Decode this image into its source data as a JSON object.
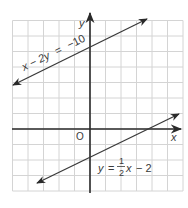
{
  "chart_data": {
    "type": "line",
    "title": "",
    "xlabel": "x",
    "ylabel": "y",
    "origin_label": "O",
    "grid": true,
    "xlim": [
      -5,
      6
    ],
    "ylim": [
      -4,
      7
    ],
    "series": [
      {
        "name": "x - 2y = -10",
        "label_parts": {
          "lhs": "x − 2y",
          "eq": "=",
          "rhs": "−10"
        },
        "slope": 0.5,
        "intercept": 5,
        "x": [
          -5,
          3.6
        ],
        "y": [
          2.5,
          6.8
        ],
        "arrows": "both"
      },
      {
        "name": "y = 1/2x - 2",
        "label_parts": {
          "lhs": "y",
          "eq": "=",
          "num": "1",
          "den": "2",
          "var": "x",
          "rest": "− 2"
        },
        "slope": 0.5,
        "intercept": -2,
        "x": [
          -3.4,
          5.8
        ],
        "y": [
          -3.7,
          0.9
        ],
        "arrows": "both"
      }
    ],
    "colors": {
      "grid": "#d4d4d4",
      "axis": "#2a2a2a",
      "line": "#3a3a3a"
    }
  }
}
